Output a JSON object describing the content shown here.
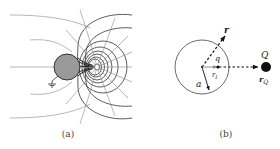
{
  "panels": [
    {
      "id": "a",
      "caption": "(a)",
      "description": "Field lines and equipotentials of a point charge near a grounded conducting sphere",
      "elements": {
        "sphere": {
          "fill": "#999999",
          "stroke": "#333333"
        },
        "ground_symbol": "ground-icon",
        "point_charge": "small open circle"
      }
    },
    {
      "id": "b",
      "caption": "(b)",
      "description": "Geometry of image charge for grounded sphere",
      "labels": {
        "r": "r",
        "q": "q",
        "r_I": "r_I",
        "a": "a",
        "Q": "Q",
        "r_Q": "r_Q"
      }
    }
  ],
  "colors": {
    "line_dark": "#333333",
    "line_light": "#888888",
    "sphere_fill": "#999999",
    "charge_fill": "#111111"
  }
}
